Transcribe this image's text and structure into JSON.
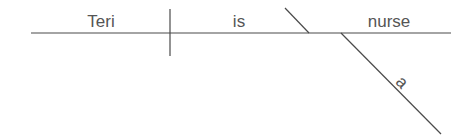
{
  "diagram": {
    "type": "sentence-diagram",
    "sentence": "Teri is a nurse",
    "subject": "Teri",
    "verb": "is",
    "predicate_nominative": "nurse",
    "modifier": "a",
    "line_color": "#4a4a4a",
    "text_color": "#555555"
  }
}
